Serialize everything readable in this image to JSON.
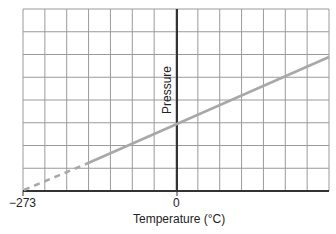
{
  "chart_data": {
    "type": "line",
    "title": "",
    "xlabel": "Temperature (°C)",
    "ylabel": "Pressure",
    "x_tick_labels": [
      "−273",
      "0"
    ],
    "x_ticks": [
      -273,
      0
    ],
    "xlim": [
      -273,
      150
    ],
    "grid": true,
    "legend": null,
    "series": [
      {
        "name": "Pressure vs Temperature (extrapolated)",
        "style": "dashed",
        "x": [
          -273,
          -87
        ],
        "y": [
          0,
          0.92
        ]
      },
      {
        "name": "Pressure vs Temperature (measured)",
        "style": "solid",
        "x": [
          -87,
          0,
          150
        ],
        "y": [
          0.92,
          1.92,
          3.0
        ]
      }
    ],
    "annotations": [
      "Line extrapolates to zero pressure at −273 °C"
    ]
  },
  "labels": {
    "x_tick_min": "−273",
    "x_tick_zero": "0",
    "xlabel": "Temperature (°C)",
    "ylabel": "Pressure"
  },
  "colors": {
    "grid": "#9a9a9a",
    "axis": "#333333",
    "line": "#a8a8a8",
    "text": "#222222"
  }
}
